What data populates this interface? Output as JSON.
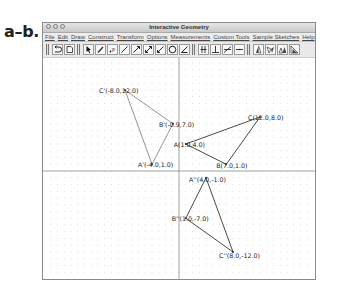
{
  "figure_label": "a–b.",
  "window": {
    "title": "Interactive Geometry",
    "menu": [
      "File",
      "Edit",
      "Draw",
      "Construct",
      "Transform",
      "Options",
      "Measurements",
      "Custom Tools",
      "Sample Sketches",
      "Help"
    ],
    "toolbar": {
      "group1": [
        "undo-icon",
        "redo-icon"
      ],
      "group2": [
        "select-arrow-icon",
        "pencil-icon",
        "point-icon",
        "segment-icon",
        "ray-icon",
        "line-icon",
        "vector-icon",
        "circle-icon",
        "angle-icon"
      ],
      "group3": [
        "parallel-icon",
        "perpendicular-icon",
        "bisector-icon",
        "midpoint-icon"
      ],
      "group4": [
        "reflect-icon",
        "rotate-icon",
        "translate-icon",
        "dilate-icon"
      ]
    }
  },
  "graph": {
    "origin_px": [
      136,
      113
    ],
    "scale_px_per_unit": 6.75,
    "triangles": [
      {
        "name": "ABC",
        "points": [
          {
            "name": "A",
            "x": 1.0,
            "y": 4.0,
            "label": "A(1.0,4.0)"
          },
          {
            "name": "B",
            "x": 7.0,
            "y": 1.0,
            "label": "B(7.0,1.0)"
          },
          {
            "name": "C",
            "x": 12.0,
            "y": 8.0,
            "label": "C(12.0,8.0)"
          }
        ]
      },
      {
        "name": "A'B'C'",
        "points": [
          {
            "name": "A'",
            "x": -4.0,
            "y": 1.0,
            "label": "A'(-4.0,1.0)"
          },
          {
            "name": "B'",
            "x": -0.9,
            "y": 7.0,
            "label": "B'(-0.9,7.0)"
          },
          {
            "name": "C'",
            "x": -8.0,
            "y": 12.0,
            "label": "C'(-8.0,12.0)"
          }
        ]
      },
      {
        "name": "A''B''C''",
        "points": [
          {
            "name": "A''",
            "x": 4.0,
            "y": -1.0,
            "label": "A''(4.0,-1.0)"
          },
          {
            "name": "B''",
            "x": 1.0,
            "y": -7.0,
            "label": "B''(1.0,-7.0)"
          },
          {
            "name": "C''",
            "x": 8.0,
            "y": -12.0,
            "label": "C''(8.0,-12.0)"
          }
        ]
      }
    ]
  }
}
